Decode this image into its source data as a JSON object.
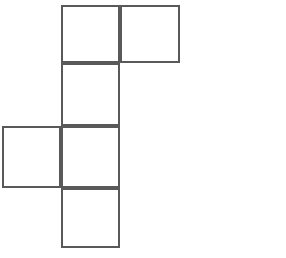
{
  "figure": {
    "name": "cube-net",
    "type": "geometric-net",
    "title": "",
    "background_color": "#ffffff",
    "stroke_color": "#595959",
    "stroke_width": 2,
    "fill_color": "#ffffff",
    "cell_size": 60,
    "grid": {
      "columns": 3,
      "rows": 4,
      "origin_x": 2,
      "origin_y": 5,
      "column_x": [
        2,
        61,
        120,
        180
      ],
      "row_y": [
        5,
        63,
        126,
        188,
        248
      ]
    },
    "squares": [
      {
        "name": "square-top-left",
        "col": 1,
        "row": 0,
        "x": 61,
        "y": 5,
        "w": 59,
        "h": 58
      },
      {
        "name": "square-top-right",
        "col": 2,
        "row": 0,
        "x": 120,
        "y": 5,
        "w": 60,
        "h": 58
      },
      {
        "name": "square-upper-middle",
        "col": 1,
        "row": 1,
        "x": 61,
        "y": 63,
        "w": 59,
        "h": 63
      },
      {
        "name": "square-center-left",
        "col": 0,
        "row": 2,
        "x": 2,
        "y": 126,
        "w": 59,
        "h": 62
      },
      {
        "name": "square-center",
        "col": 1,
        "row": 2,
        "x": 61,
        "y": 126,
        "w": 59,
        "h": 62
      },
      {
        "name": "square-bottom",
        "col": 1,
        "row": 3,
        "x": 61,
        "y": 188,
        "w": 59,
        "h": 60
      }
    ],
    "square_count": 6
  }
}
